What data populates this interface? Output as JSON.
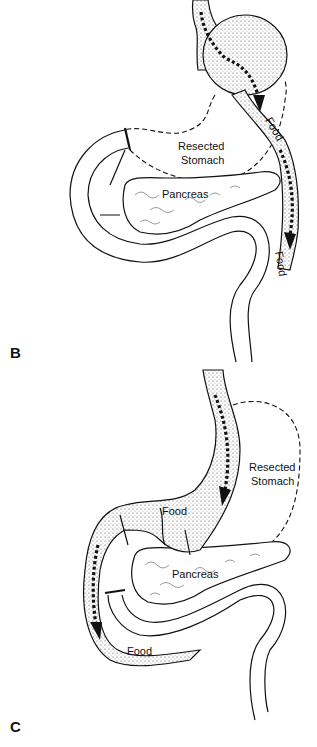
{
  "figure": {
    "panels": [
      {
        "id": "B",
        "label": "B",
        "labels": {
          "resected": "Resected",
          "stomach": "Stomach",
          "pancreas": "Pancreas",
          "food_upper": "Food",
          "food_lower": "Food"
        }
      },
      {
        "id": "C",
        "label": "C",
        "labels": {
          "resected": "Resected",
          "stomach": "Stomach",
          "pancreas": "Pancreas",
          "food_upper": "Food",
          "food_lower": "Food"
        }
      }
    ]
  }
}
